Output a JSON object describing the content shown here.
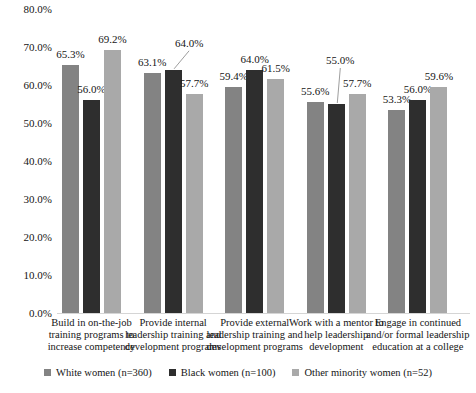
{
  "chart_data": {
    "type": "bar",
    "title": "",
    "xlabel": "",
    "ylabel": "",
    "categories": [
      "Build in on-the-job training programs to increase competency",
      "Provide internal leadership training and development programs",
      "Provide external leadership training and development programs",
      "Work with a mentor to help leadership development",
      "Engage in continued and/or formal leadership education at a college"
    ],
    "series": [
      {
        "name": "White women (n=360)",
        "color": "#838383",
        "values": [
          65.3,
          63.1,
          59.4,
          55.6,
          53.3
        ]
      },
      {
        "name": "Black women (n=100)",
        "color": "#2e2e2e",
        "values": [
          56.0,
          64.0,
          64.0,
          55.0,
          56.0
        ]
      },
      {
        "name": "Other minority women (n=52)",
        "color": "#a9a9a9",
        "values": [
          69.2,
          57.7,
          61.5,
          57.7,
          59.6
        ]
      }
    ],
    "data_labels": [
      [
        "65.3%",
        "63.1%",
        "59.4%",
        "55.6%",
        "53.3%"
      ],
      [
        "56.0%",
        "64.0%",
        "64.0%",
        "55.0%",
        "56.0%"
      ],
      [
        "69.2%",
        "57.7%",
        "61.5%",
        "57.7%",
        "59.6%"
      ]
    ],
    "ylim": [
      0,
      80
    ],
    "ytick_step": 10,
    "ytick_labels": [
      "0.0%",
      "10.0%",
      "20.0%",
      "30.0%",
      "40.0%",
      "50.0%",
      "60.0%",
      "70.0%",
      "80.0%"
    ],
    "grid": false,
    "legend_position": "bottom",
    "callouts": [
      {
        "category": 1,
        "series": 1,
        "dx": 16,
        "dy": -16
      },
      {
        "category": 3,
        "series": 1,
        "dx": 4,
        "dy": -33
      }
    ],
    "callout_line_color": "#9e9e9e",
    "axis_line_color": "#d5d5d5"
  }
}
